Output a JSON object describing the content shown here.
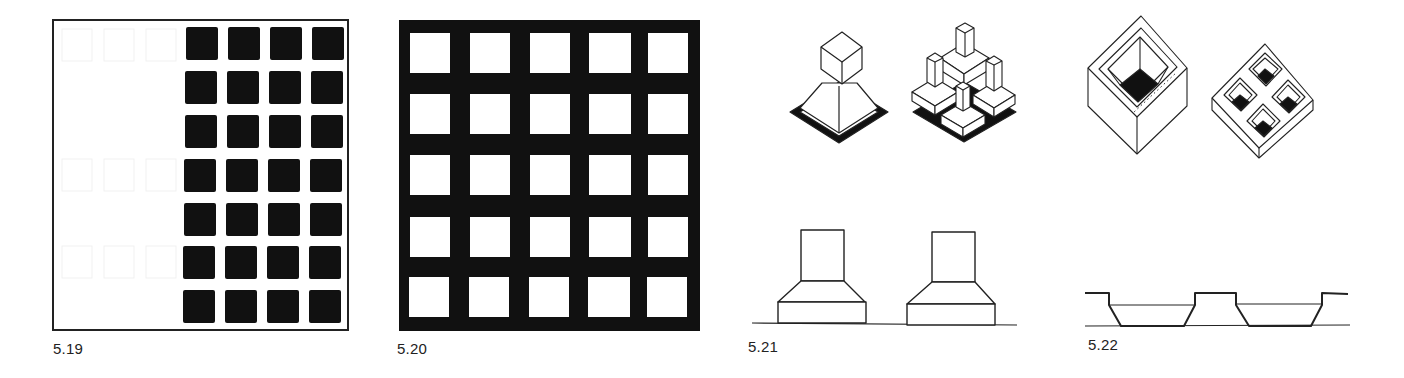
{
  "page": {
    "background": "#ffffff",
    "ink": "#111111"
  },
  "figures": [
    {
      "id": "fig-5-19",
      "caption": "5.19",
      "description": "Framed square with 4 columns x 7 rows of solid black squares occupying the right portion; left portion blank",
      "grid": {
        "columns": 4,
        "rows": 7,
        "fill": "#111111"
      }
    },
    {
      "id": "fig-5-20",
      "caption": "5.20",
      "description": "Solid black square pierced by a 5 x 5 grid of white square openings",
      "grid": {
        "columns": 5,
        "rows": 5,
        "hole_fill": "#ffffff",
        "field_fill": "#111111"
      }
    },
    {
      "id": "fig-5-21",
      "caption": "5.21",
      "description": "Two isometric massings on black diamond bases (single stepped tower; four stepped towers) above two elevations of stepped tower on base",
      "views": [
        "isometric-single-tower",
        "isometric-four-towers",
        "elevation-left",
        "elevation-right"
      ]
    },
    {
      "id": "fig-5-22",
      "caption": "5.22",
      "description": "Two isometric hollow blocks (single deep well; four sunken wells) above a section with two tapered pockets",
      "views": [
        "isometric-single-well",
        "isometric-four-wells",
        "section"
      ]
    }
  ]
}
